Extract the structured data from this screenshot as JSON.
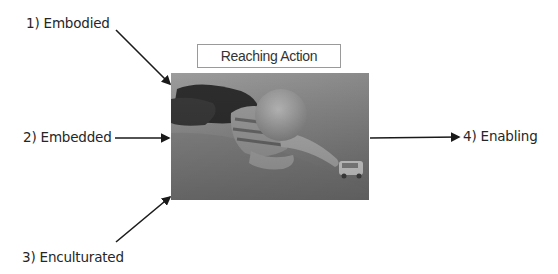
{
  "diagram": {
    "title": "Reaching Action",
    "center_image": {
      "description": "Grayscale photo of an infant lying prone on a carpet, reaching toward a small toy car"
    },
    "inputs": [
      {
        "label": "1) Embodied",
        "arrow_direction": "down-right"
      },
      {
        "label": "2) Embedded",
        "arrow_direction": "right"
      },
      {
        "label": "3) Enculturated",
        "arrow_direction": "up-right"
      }
    ],
    "output": {
      "label": "4) Enabling",
      "arrow_direction": "right"
    }
  }
}
